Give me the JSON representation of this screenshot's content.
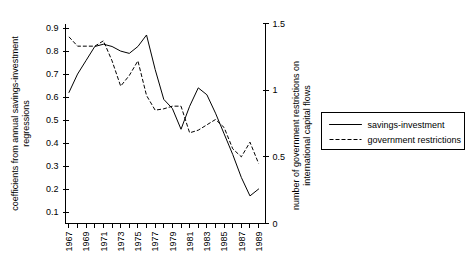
{
  "chart_data": {
    "type": "line",
    "title": "",
    "xlabel": "",
    "ylabel": "coefficients from annual savings-investment regressions",
    "y2label": "number of government restrictions on international capital flows",
    "ylabel_line1": "coefficients from annual savings-investment",
    "ylabel_line2": "regressions",
    "y2label_line1": "number of government restrictions on",
    "y2label_line2": "international capital flows",
    "grid": false,
    "legend_position": "right",
    "x": [
      1967,
      1968,
      1969,
      1970,
      1971,
      1972,
      1973,
      1974,
      1975,
      1976,
      1977,
      1978,
      1979,
      1980,
      1981,
      1982,
      1983,
      1984,
      1985,
      1986,
      1987,
      1988,
      1989
    ],
    "xlim": [
      1966.6,
      1989.8
    ],
    "xticks_all": [
      1967,
      1968,
      1969,
      1970,
      1971,
      1972,
      1973,
      1974,
      1975,
      1976,
      1977,
      1978,
      1979,
      1980,
      1981,
      1982,
      1983,
      1984,
      1985,
      1986,
      1987,
      1988,
      1989
    ],
    "xticklabels": [
      "1967",
      "",
      "1969",
      "",
      "1971",
      "",
      "1973",
      "",
      "1975",
      "",
      "1977",
      "",
      "1979",
      "",
      "1981",
      "",
      "1983",
      "",
      "1985",
      "",
      "1987",
      "",
      "1989"
    ],
    "ylim": [
      0.05,
      0.92
    ],
    "yticks": [
      0.1,
      0.2,
      0.3,
      0.4,
      0.5,
      0.6,
      0.7,
      0.8,
      0.9
    ],
    "yticklabels": [
      "0.1",
      "0.2",
      "0.3",
      "0.4",
      "0.5",
      "0.6",
      "0.7",
      "0.8",
      "0.9"
    ],
    "y2lim": [
      0.0,
      1.5
    ],
    "y2ticks": [
      0,
      0.5,
      1,
      1.5
    ],
    "y2ticklabels": [
      "0",
      "0.5",
      "1",
      "1.5"
    ],
    "series": [
      {
        "name": "savings-investment",
        "style": "solid",
        "axis": "left",
        "values": [
          0.62,
          0.7,
          0.76,
          0.82,
          0.83,
          0.82,
          0.8,
          0.79,
          0.82,
          0.87,
          0.72,
          0.59,
          0.55,
          0.46,
          0.56,
          0.64,
          0.61,
          0.53,
          0.44,
          0.35,
          0.25,
          0.17,
          0.2
        ]
      },
      {
        "name": "government restrictions",
        "style": "dashed",
        "axis": "right",
        "values": [
          1.4,
          1.33,
          1.33,
          1.33,
          1.37,
          1.22,
          1.03,
          1.11,
          1.22,
          0.96,
          0.85,
          0.86,
          0.88,
          0.88,
          0.68,
          0.7,
          0.74,
          0.78,
          0.72,
          0.56,
          0.5,
          0.61,
          0.45
        ]
      }
    ],
    "legend": [
      {
        "label": "savings-investment",
        "style": "solid"
      },
      {
        "label": "government restrictions",
        "style": "dashed"
      }
    ]
  }
}
